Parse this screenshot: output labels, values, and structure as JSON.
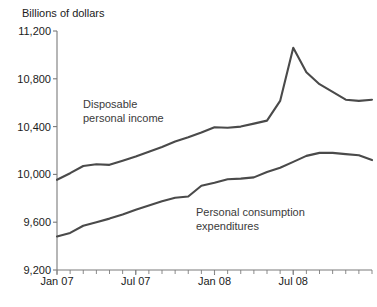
{
  "chart_data": {
    "type": "line",
    "title": "",
    "subtitle": "",
    "ylabel": "Billions of dollars",
    "xlabel": "",
    "ylim": [
      9200,
      11200
    ],
    "yticks": [
      9200,
      9600,
      10000,
      10400,
      10800,
      11200
    ],
    "ytick_labels": [
      "9,200",
      "9,600",
      "10,000",
      "10,400",
      "10,800",
      "11,200"
    ],
    "xticks": [
      0,
      6,
      12,
      18
    ],
    "xtick_labels": [
      "Jan 07",
      "Jul 07",
      "Jan 08",
      "Jul 08"
    ],
    "x_minor_count": 25,
    "grid": false,
    "legend_position": "inline-annotations",
    "x": [
      0,
      1,
      2,
      3,
      4,
      5,
      6,
      7,
      8,
      9,
      10,
      11,
      12,
      13,
      14,
      15,
      16,
      17,
      18,
      19,
      20,
      21,
      22,
      23,
      24
    ],
    "series": [
      {
        "name": "Disposable personal income",
        "color": "#4a4a4a",
        "values": [
          9955,
          10010,
          10070,
          10085,
          10080,
          10115,
          10150,
          10190,
          10230,
          10275,
          10310,
          10350,
          10395,
          10390,
          10400,
          10425,
          10450,
          10615,
          11060,
          10855,
          10755,
          10690,
          10625,
          10615,
          10625
        ]
      },
      {
        "name": "Personal consumption expenditures",
        "color": "#4a4a4a",
        "values": [
          9480,
          9510,
          9570,
          9600,
          9630,
          9665,
          9705,
          9740,
          9775,
          9805,
          9815,
          9905,
          9930,
          9960,
          9965,
          9975,
          10020,
          10055,
          10105,
          10155,
          10180,
          10180,
          10170,
          10160,
          10120
        ]
      }
    ],
    "annotations": [
      {
        "name": "disposable-personal-income-label",
        "lines": [
          "Disposable",
          "personal income"
        ],
        "x_px": 83,
        "y_px": 108
      },
      {
        "name": "personal-consumption-expenditures-label",
        "lines": [
          "Personal consumption",
          "expenditures"
        ],
        "x_px": 196,
        "y_px": 216
      }
    ]
  },
  "caption": {
    "text": ""
  }
}
